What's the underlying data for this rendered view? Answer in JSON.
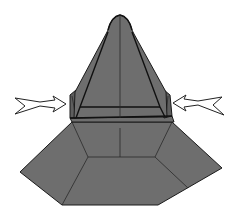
{
  "diagram": {
    "colors": {
      "paper": "#6e6e6e",
      "paper_shadow": "#5e5e5e",
      "outline": "#1a1a1a",
      "arrow_fill": "#ffffff",
      "background": "#ffffff"
    },
    "parts": [
      {
        "id": "tip",
        "label": "rounded tip"
      },
      {
        "id": "pyramid",
        "label": "upper pyramid"
      },
      {
        "id": "left-flap",
        "label": "left side flap"
      },
      {
        "id": "right-flap",
        "label": "right side flap"
      },
      {
        "id": "band",
        "label": "horizontal band"
      },
      {
        "id": "skirt",
        "label": "hexagonal base skirt"
      }
    ],
    "arrows": [
      {
        "id": "left-arrow",
        "direction": "right",
        "meaning": "push flap inward"
      },
      {
        "id": "right-arrow",
        "direction": "left",
        "meaning": "push flap inward"
      }
    ]
  }
}
